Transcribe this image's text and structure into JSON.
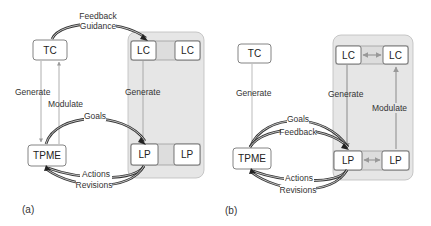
{
  "panels": [
    {
      "caption": "(a)",
      "nodes": {
        "tc": "TC",
        "tpme": "TPME",
        "lc1": "LC",
        "lc2": "LC",
        "lp1": "LP",
        "lp2": "LP"
      },
      "edges": {
        "feedback": "Feedback",
        "guidance": "Guidance",
        "generate_left": "Generate",
        "modulate_left": "Modulate",
        "goals": "Goals",
        "generate_right": "Generate",
        "actions": "Actions",
        "revisions": "Revisions"
      }
    },
    {
      "caption": "(b)",
      "nodes": {
        "tc": "TC",
        "tpme": "TPME",
        "lc1": "LC",
        "lc2": "LC",
        "lp1": "LP",
        "lp2": "LP"
      },
      "edges": {
        "generate_left": "Generate",
        "goals": "Goals",
        "feedback": "Feedback",
        "generate_right": "Generate",
        "modulate_right": "Modulate",
        "actions": "Actions",
        "revisions": "Revisions"
      }
    }
  ],
  "colors": {
    "panel_fill": "#e6e6e6",
    "box_stroke": "#555555",
    "thick_arrow": "#333333",
    "thin_arrow": "#999999"
  }
}
